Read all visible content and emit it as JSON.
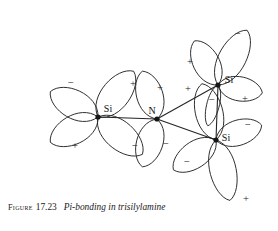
{
  "figure": {
    "caption_label": "Figure",
    "caption_number": "17.23",
    "caption_title": "Pi-bonding in trisilylamine",
    "background_color": "#ffffff",
    "ink_color": "#252525"
  },
  "diagram": {
    "type": "molecular-orbital-diagram",
    "molecule": "trisilylamine",
    "atoms": [
      {
        "id": "si-left",
        "element": "Si",
        "label": "Si",
        "x": 98,
        "y": 117,
        "label_x": 108,
        "label_y": 108
      },
      {
        "id": "n-center",
        "element": "N",
        "label": "N",
        "x": 157,
        "y": 119,
        "label_x": 152,
        "label_y": 110
      },
      {
        "id": "si-top-right",
        "element": "Si",
        "label": "Si",
        "x": 218,
        "y": 85,
        "label_x": 229,
        "label_y": 79
      },
      {
        "id": "si-bottom-right",
        "element": "Si",
        "label": "Si",
        "x": 216,
        "y": 140,
        "label_x": 226,
        "label_y": 137
      }
    ],
    "bonds": [
      {
        "id": "bond-si-left-n",
        "from": "si-left",
        "to": "n-center"
      },
      {
        "id": "bond-n-si-top-right",
        "from": "n-center",
        "to": "si-top-right"
      },
      {
        "id": "bond-n-si-bottom-right",
        "from": "n-center",
        "to": "si-bottom-right"
      },
      {
        "id": "bond-si-top-bottom",
        "from": "si-top-right",
        "to": "si-bottom-right"
      }
    ],
    "lobes": [
      {
        "id": "lobe-si-left-upper-left",
        "atom": "si-left",
        "sign": "−",
        "angle": 152,
        "length": 54,
        "width": 27,
        "sign_x": 71,
        "sign_y": 82
      },
      {
        "id": "lobe-si-left-lower-left",
        "atom": "si-left",
        "sign": "+",
        "angle": 208,
        "length": 54,
        "width": 27,
        "sign_x": 75,
        "sign_y": 145
      },
      {
        "id": "lobe-si-left-upper-right",
        "atom": "si-left",
        "sign": "+",
        "angle": 52,
        "length": 58,
        "width": 27,
        "sign_x": 133,
        "sign_y": 83
      },
      {
        "id": "lobe-si-left-lower-right",
        "atom": "si-left",
        "sign": "−",
        "angle": 320,
        "length": 58,
        "width": 27,
        "sign_x": 135,
        "sign_y": 145
      },
      {
        "id": "lobe-n-upper-left",
        "atom": "n-center",
        "sign": "+",
        "angle": 107,
        "length": 50,
        "width": 25,
        "sign_x": 160,
        "sign_y": 87
      },
      {
        "id": "lobe-n-lower-left",
        "atom": "n-center",
        "sign": "−",
        "angle": 253,
        "length": 50,
        "width": 25,
        "sign_x": 166,
        "sign_y": 143
      },
      {
        "id": "lobe-si-top-right-upper",
        "atom": "si-top-right",
        "sign": "−",
        "angle": 62,
        "length": 62,
        "width": 26,
        "sign_x": 238,
        "sign_y": 33
      },
      {
        "id": "lobe-si-top-right-left",
        "atom": "si-top-right",
        "sign": "+",
        "angle": 118,
        "length": 50,
        "width": 25,
        "sign_x": 190,
        "sign_y": 61
      },
      {
        "id": "lobe-si-top-right-right",
        "atom": "si-top-right",
        "sign": "+",
        "angle": 350,
        "length": 45,
        "width": 23,
        "sign_x": 245,
        "sign_y": 98
      },
      {
        "id": "lobe-si-top-right-down",
        "atom": "si-top-right",
        "sign": "−",
        "angle": 256,
        "length": 42,
        "width": 12,
        "sign_x": 212,
        "sign_y": 99
      },
      {
        "id": "lobe-si-bot-right-upper",
        "atom": "si-bottom-right",
        "sign": "+",
        "angle": 104,
        "length": 58,
        "width": 26,
        "sign_x": 188,
        "sign_y": 88
      },
      {
        "id": "lobe-si-bot-right-lowleft",
        "atom": "si-bottom-right",
        "sign": "−",
        "angle": 215,
        "length": 52,
        "width": 25,
        "sign_x": 187,
        "sign_y": 161
      },
      {
        "id": "lobe-si-bot-right-right",
        "atom": "si-bottom-right",
        "sign": "−",
        "angle": 18,
        "length": 48,
        "width": 24,
        "sign_x": 248,
        "sign_y": 124
      },
      {
        "id": "lobe-si-bot-right-down",
        "atom": "si-bottom-right",
        "sign": "+",
        "angle": 283,
        "length": 62,
        "width": 25,
        "sign_x": 246,
        "sign_y": 198
      }
    ]
  }
}
